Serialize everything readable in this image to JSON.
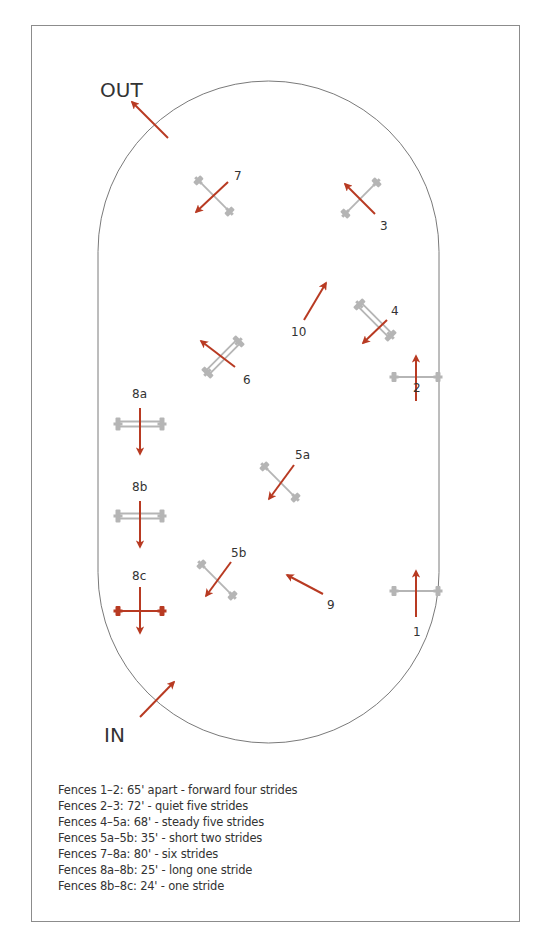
{
  "colors": {
    "arrow": "#b83a22",
    "fence": "#b5b5b5",
    "fence_highlight": "#b83a22",
    "arena_outline": "#7a7a7a",
    "frame": "#8c8c8c",
    "text": "#333333"
  },
  "arena": {
    "x": 98,
    "y": 81,
    "width": 341,
    "height": 662,
    "radius": 170.5
  },
  "gates": [
    {
      "id": "out",
      "label": "OUT",
      "label_x": 100,
      "label_y": 97,
      "label_size": 20,
      "arrow": {
        "x1": 168,
        "y1": 138,
        "x2": 132,
        "y2": 102
      }
    },
    {
      "id": "in",
      "label": "IN",
      "label_x": 104,
      "label_y": 742,
      "label_size": 20,
      "arrow": {
        "x1": 140,
        "y1": 717,
        "x2": 174,
        "y2": 682
      }
    }
  ],
  "fences": [
    {
      "id": "1",
      "label": "1",
      "label_x": 413,
      "label_y": 636,
      "type": "vertical",
      "cx": 416,
      "cy": 591,
      "angle": 0,
      "color": "fence",
      "arrow": {
        "x1": 416,
        "y1": 617,
        "x2": 416,
        "y2": 571
      }
    },
    {
      "id": "2",
      "label": "2",
      "label_x": 413,
      "label_y": 392,
      "type": "vertical",
      "cx": 416,
      "cy": 377,
      "angle": 0,
      "color": "fence",
      "arrow": {
        "x1": 416,
        "y1": 401,
        "x2": 416,
        "y2": 356
      }
    },
    {
      "id": "3",
      "label": "3",
      "label_x": 380,
      "label_y": 230,
      "type": "vertical",
      "cx": 361,
      "cy": 198,
      "angle": -45,
      "color": "fence",
      "arrow": {
        "x1": 375,
        "y1": 214,
        "x2": 345,
        "y2": 184
      }
    },
    {
      "id": "4",
      "label": "4",
      "label_x": 391,
      "label_y": 315,
      "type": "oxer",
      "cx": 375,
      "cy": 320,
      "angle": 45,
      "color": "fence",
      "arrow": {
        "x1": 387,
        "y1": 320,
        "x2": 363,
        "y2": 343
      }
    },
    {
      "id": "5a",
      "label": "5a",
      "label_x": 295,
      "label_y": 459,
      "type": "vertical",
      "cx": 280,
      "cy": 482,
      "angle": 45,
      "color": "fence",
      "arrow": {
        "x1": 294,
        "y1": 465,
        "x2": 269,
        "y2": 499
      }
    },
    {
      "id": "5b",
      "label": "5b",
      "label_x": 231,
      "label_y": 557,
      "type": "vertical",
      "cx": 217,
      "cy": 580,
      "angle": 45,
      "color": "fence",
      "arrow": {
        "x1": 231,
        "y1": 562,
        "x2": 206,
        "y2": 596
      }
    },
    {
      "id": "6",
      "label": "6",
      "label_x": 243,
      "label_y": 384,
      "type": "oxer",
      "cx": 223,
      "cy": 357,
      "angle": -45,
      "color": "fence",
      "arrow": {
        "x1": 235,
        "y1": 367,
        "x2": 201,
        "y2": 341
      }
    },
    {
      "id": "7",
      "label": "7",
      "label_x": 234,
      "label_y": 180,
      "type": "vertical",
      "cx": 214,
      "cy": 196,
      "angle": 45,
      "color": "fence",
      "arrow": {
        "x1": 228,
        "y1": 182,
        "x2": 196,
        "y2": 212
      }
    },
    {
      "id": "8a",
      "label": "8a",
      "label_x": 132,
      "label_y": 398,
      "type": "oxer",
      "cx": 140,
      "cy": 424,
      "angle": 0,
      "color": "fence",
      "arrow": {
        "x1": 140,
        "y1": 408,
        "x2": 140,
        "y2": 454
      }
    },
    {
      "id": "8b",
      "label": "8b",
      "label_x": 132,
      "label_y": 491,
      "type": "oxer",
      "cx": 140,
      "cy": 516,
      "angle": 0,
      "color": "fence",
      "arrow": {
        "x1": 140,
        "y1": 501,
        "x2": 140,
        "y2": 547
      }
    },
    {
      "id": "8c",
      "label": "8c",
      "label_x": 132,
      "label_y": 580,
      "type": "vertical",
      "cx": 140,
      "cy": 611,
      "angle": 0,
      "color": "fence_highlight",
      "arrow": {
        "x1": 140,
        "y1": 587,
        "x2": 140,
        "y2": 633
      }
    }
  ],
  "tracks": [
    {
      "id": "9",
      "label": "9",
      "label_x": 327,
      "label_y": 609,
      "arrow": {
        "x1": 323,
        "y1": 594,
        "x2": 287,
        "y2": 575
      }
    },
    {
      "id": "10",
      "label": "10",
      "label_x": 291,
      "label_y": 336,
      "arrow": {
        "x1": 304,
        "y1": 320,
        "x2": 326,
        "y2": 283
      }
    }
  ],
  "legend": [
    "Fences 1–2:  65' apart - forward four strides",
    "Fences 2–3:  72' - quiet five strides",
    "Fences 4–5a:  68' - steady five strides",
    "Fences 5a–5b:  35' - short two strides",
    "Fences 7–8a:  80' - six strides",
    "Fences 8a–8b:  25' - long one stride",
    "Fences 8b–8c:  24' - one stride"
  ]
}
